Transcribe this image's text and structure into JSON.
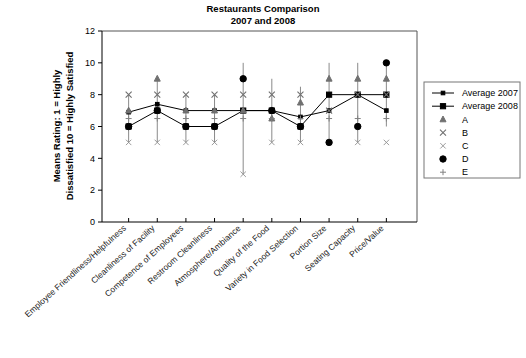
{
  "chart_data": {
    "type": "line",
    "title": "Restaurants Comparison",
    "subtitle": "2007 and 2008",
    "ylabel_line1": "Means Rating:  1 = Highly",
    "ylabel_line2": "Dissatisfied  10 = Highly Satisfied",
    "xlabel": "",
    "ylim": [
      0,
      12
    ],
    "yticks": [
      0,
      2,
      4,
      6,
      8,
      10,
      12
    ],
    "ytick_labels": [
      "0",
      "2",
      "4",
      "6",
      "8",
      "10",
      "12"
    ],
    "grid": false,
    "legend_position": "right",
    "categories": [
      "Employee Friendliness/Helpfulness",
      "Cleanliness of Facility",
      "Competence of Employees",
      "Restroom Cleanliness",
      "Atmosphere/Ambiance",
      "Quality of the Food",
      "Variety in Food Selection",
      "Portion Size",
      "Seating Capacity",
      "Price/Value"
    ],
    "series": [
      {
        "name": "Average 2007",
        "marker": "small-square",
        "values": [
          6.9,
          7.4,
          7.0,
          7.0,
          7.0,
          7.0,
          6.6,
          7.0,
          8.0,
          7.0
        ]
      },
      {
        "name": "Average 2008",
        "marker": "square",
        "values": [
          6.0,
          7.0,
          6.0,
          6.0,
          7.0,
          7.0,
          6.0,
          8.0,
          8.0,
          8.0
        ]
      },
      {
        "name": "A",
        "marker": "triangle",
        "values": [
          7.0,
          9.0,
          7.0,
          7.0,
          7.0,
          6.5,
          7.5,
          9.0,
          9.0,
          9.0
        ]
      },
      {
        "name": "B",
        "marker": "x",
        "values": [
          8.0,
          8.0,
          8.0,
          8.0,
          8.0,
          8.0,
          8.0,
          7.0,
          8.0,
          8.0
        ]
      },
      {
        "name": "C",
        "marker": "x-thin",
        "values": [
          5.0,
          5.0,
          5.0,
          5.0,
          3.0,
          5.0,
          5.0,
          5.0,
          5.0,
          5.0
        ]
      },
      {
        "name": "D",
        "marker": "circle",
        "values": [
          6.0,
          7.0,
          6.0,
          6.0,
          9.0,
          7.0,
          6.0,
          5.0,
          6.0,
          10.0
        ]
      },
      {
        "name": "E",
        "marker": "plus",
        "values": [
          6.5,
          6.5,
          6.5,
          6.5,
          6.5,
          6.5,
          6.5,
          6.5,
          6.5,
          6.5
        ]
      }
    ],
    "ranges": [
      {
        "low": 5.0,
        "high": 8.0
      },
      {
        "low": 5.0,
        "high": 9.0
      },
      {
        "low": 5.0,
        "high": 8.0
      },
      {
        "low": 5.0,
        "high": 8.0
      },
      {
        "low": 3.0,
        "high": 10.0
      },
      {
        "low": 5.0,
        "high": 9.0
      },
      {
        "low": 5.0,
        "high": 8.5
      },
      {
        "low": 5.0,
        "high": 10.0
      },
      {
        "low": 5.0,
        "high": 10.0
      },
      {
        "low": 6.0,
        "high": 10.0
      }
    ]
  },
  "legend": {
    "entries": [
      {
        "label": "Average 2007",
        "marker": "line-small-square"
      },
      {
        "label": "Average 2008",
        "marker": "line-square"
      },
      {
        "label": "A",
        "marker": "triangle"
      },
      {
        "label": "B",
        "marker": "x"
      },
      {
        "label": "C",
        "marker": "x-thin"
      },
      {
        "label": "D",
        "marker": "circle"
      },
      {
        "label": "E",
        "marker": "plus"
      }
    ]
  },
  "colors": {
    "axis": "#000000",
    "frame": "#555555",
    "marker_grey": "#707070",
    "marker_black": "#000000",
    "background": "#ffffff"
  }
}
